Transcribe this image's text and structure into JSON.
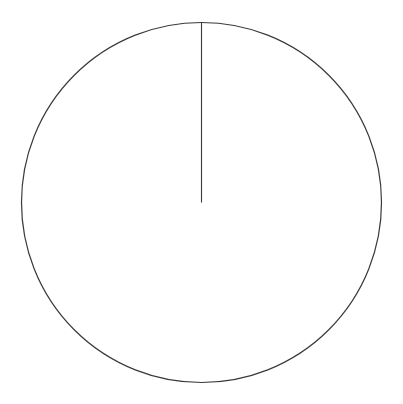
{
  "figure": {
    "width": 403,
    "height": 404,
    "background_color": "#ffffff"
  },
  "chart_data": {
    "type": "pie",
    "title": "",
    "subtitle": "",
    "xlabel": "",
    "ylabel": "",
    "labels": [
      ""
    ],
    "values": [
      100
    ],
    "percentages": [
      100.0
    ],
    "colors": [
      "#ffffff"
    ],
    "edge_color": "#333333",
    "edge_width": 1.2,
    "start_angle": 90,
    "counterclock": true,
    "legend": false,
    "legend_position": "none",
    "grid": false,
    "annotations": [],
    "tick_labels": [],
    "autopct": null,
    "shadow": false,
    "wedge_count": 1,
    "slice_divider_count": 1,
    "center_x": 201.5,
    "center_y": 202.5,
    "radius": 180,
    "divider_angle_degrees": 90,
    "divider_clock_position": "12 o'clock"
  },
  "geometry": {
    "circle": {
      "cx": 201.5,
      "cy": 202.5,
      "r": 180,
      "stroke": "#3a3a3a",
      "stroke_width": 1.2,
      "fill": "none"
    },
    "divider_line": {
      "x1": 201.5,
      "y1": 202.5,
      "x2": 201.5,
      "y2": 22.5,
      "stroke": "#3a3a3a",
      "stroke_width": 1.1
    }
  }
}
